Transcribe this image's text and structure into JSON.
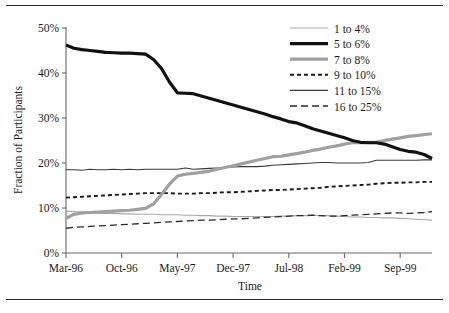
{
  "figure": {
    "top_rule": "horizontal-rule",
    "bottom_rule": "horizontal-rule"
  },
  "chart_data": {
    "type": "line",
    "title": "",
    "xlabel": "Time",
    "ylabel": "Fraction of Participants",
    "ylim": [
      0,
      50
    ],
    "yticks": [
      0,
      10,
      20,
      30,
      40,
      50
    ],
    "ytick_labels": [
      "0%",
      "10%",
      "20%",
      "30%",
      "40%",
      "50%"
    ],
    "grid": false,
    "legend_position": "top-right",
    "x_index_range": [
      0,
      46
    ],
    "xtick_indices": [
      0,
      7,
      14,
      21,
      28,
      35,
      42
    ],
    "xtick_labels": [
      "Mar-96",
      "Oct-96",
      "May-97",
      "Dec-97",
      "Jul-98",
      "Feb-99",
      "Sep-99"
    ],
    "series": [
      {
        "name": "1 to 4%",
        "color": "#a8a8a8",
        "width": 1.1,
        "dash": "none",
        "values": [
          9.3,
          9.2,
          9.1,
          9.0,
          8.9,
          8.8,
          8.8,
          8.7,
          8.7,
          8.6,
          8.6,
          8.6,
          8.5,
          8.5,
          8.5,
          8.4,
          8.4,
          8.3,
          8.3,
          8.2,
          8.2,
          8.1,
          8.1,
          8.1,
          8.1,
          8.1,
          8.1,
          8.2,
          8.2,
          8.3,
          8.3,
          8.4,
          8.3,
          8.3,
          8.2,
          8.1,
          8.0,
          8.0,
          7.9,
          7.9,
          7.8,
          7.8,
          7.7,
          7.6,
          7.5,
          7.4,
          7.3
        ]
      },
      {
        "name": "5 to 6%",
        "color": "#111111",
        "width": 3.2,
        "dash": "none",
        "values": [
          46.2,
          45.5,
          45.2,
          45.0,
          44.8,
          44.6,
          44.5,
          44.4,
          44.4,
          44.3,
          44.2,
          43.0,
          41.0,
          38.0,
          35.6,
          35.5,
          35.4,
          34.9,
          34.4,
          33.9,
          33.4,
          32.9,
          32.4,
          31.9,
          31.4,
          30.9,
          30.3,
          29.8,
          29.2,
          28.9,
          28.3,
          27.6,
          27.1,
          26.6,
          26.1,
          25.6,
          25.0,
          24.6,
          24.5,
          24.5,
          24.2,
          23.6,
          23.0,
          22.6,
          22.4,
          21.9,
          21.0
        ]
      },
      {
        "name": "7 to 8%",
        "color": "#a0a0a0",
        "width": 3.2,
        "dash": "none",
        "values": [
          7.7,
          8.6,
          8.9,
          9.0,
          9.1,
          9.2,
          9.3,
          9.4,
          9.5,
          9.7,
          9.9,
          10.9,
          13.0,
          15.3,
          17.1,
          17.5,
          17.7,
          17.9,
          18.2,
          18.6,
          19.0,
          19.4,
          19.8,
          20.2,
          20.6,
          21.0,
          21.4,
          21.5,
          21.8,
          22.1,
          22.4,
          22.8,
          23.1,
          23.5,
          23.8,
          24.2,
          24.5,
          24.5,
          24.6,
          24.6,
          25.0,
          25.3,
          25.6,
          25.9,
          26.1,
          26.3,
          26.5
        ]
      },
      {
        "name": "9 to 10%",
        "color": "#1a1a1a",
        "width": 1.9,
        "dash": "4,3",
        "values": [
          12.3,
          12.4,
          12.5,
          12.6,
          12.7,
          12.8,
          12.9,
          13.0,
          13.1,
          13.2,
          13.3,
          13.3,
          13.3,
          13.3,
          13.2,
          13.2,
          13.2,
          13.3,
          13.3,
          13.4,
          13.5,
          13.5,
          13.6,
          13.7,
          13.8,
          13.9,
          14.0,
          14.0,
          14.1,
          14.2,
          14.3,
          14.4,
          14.5,
          14.7,
          14.8,
          14.9,
          15.0,
          15.1,
          15.2,
          15.4,
          15.5,
          15.6,
          15.6,
          15.7,
          15.7,
          15.8,
          15.8
        ]
      },
      {
        "name": "11 to 15%",
        "color": "#3a3a3a",
        "width": 1.1,
        "dash": "none",
        "values": [
          18.5,
          18.5,
          18.4,
          18.6,
          18.5,
          18.5,
          18.6,
          18.5,
          18.6,
          18.5,
          18.6,
          18.6,
          18.6,
          18.6,
          18.6,
          18.9,
          18.6,
          18.7,
          18.8,
          18.9,
          19.0,
          19.1,
          19.2,
          19.2,
          19.2,
          19.3,
          19.5,
          19.6,
          19.7,
          19.8,
          19.9,
          20.0,
          20.1,
          20.1,
          20.0,
          20.0,
          20.0,
          20.0,
          20.1,
          20.6,
          20.6,
          20.6,
          20.6,
          20.6,
          20.6,
          20.7,
          20.7
        ]
      },
      {
        "name": "16 to 25%",
        "color": "#2a2a2a",
        "width": 1.3,
        "dash": "7,4",
        "values": [
          5.5,
          5.7,
          5.8,
          5.9,
          6.0,
          6.1,
          6.2,
          6.3,
          6.4,
          6.5,
          6.6,
          6.7,
          6.8,
          6.9,
          7.0,
          7.1,
          7.2,
          7.3,
          7.3,
          7.4,
          7.5,
          7.6,
          7.6,
          7.7,
          7.8,
          7.9,
          8.0,
          8.1,
          8.2,
          8.3,
          8.3,
          8.4,
          8.3,
          8.2,
          8.2,
          8.3,
          8.4,
          8.5,
          8.6,
          8.7,
          8.8,
          8.9,
          8.9,
          8.8,
          8.9,
          9.0,
          9.2
        ]
      }
    ]
  },
  "legend": {
    "entries": [
      "1 to 4%",
      "5 to 6%",
      "7 to 8%",
      "9 to 10%",
      "11 to 15%",
      "16 to 25%"
    ]
  }
}
